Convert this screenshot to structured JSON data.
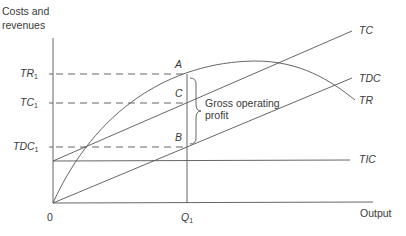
{
  "diagram": {
    "title_axis_y": [
      "Costs and",
      "revenues"
    ],
    "axis_x_label": "Output",
    "origin_label": "0",
    "y_ticks": [
      {
        "label": "TR",
        "sub": "1"
      },
      {
        "label": "TC",
        "sub": "1"
      },
      {
        "label": "TDC",
        "sub": "1"
      }
    ],
    "x_tick": {
      "label": "Q",
      "sub": "1"
    },
    "curves": [
      {
        "name": "TC",
        "label": "TC",
        "type": "line",
        "desc": "Total cost, starts at TIC intercept"
      },
      {
        "name": "TDC",
        "label": "TDC",
        "type": "line",
        "desc": "Total direct cost, from origin"
      },
      {
        "name": "TR",
        "label": "TR",
        "type": "curve",
        "desc": "Total revenue, concave from origin"
      },
      {
        "name": "TIC",
        "label": "TIC",
        "type": "horizontal",
        "desc": "Total indirect cost"
      }
    ],
    "points": {
      "A": "A",
      "B": "B",
      "C": "C"
    },
    "brace_label": [
      "Gross operating",
      "profit"
    ],
    "colors": {
      "line": "#555555",
      "text": "#3a3a3a",
      "background": "#ffffff"
    }
  }
}
